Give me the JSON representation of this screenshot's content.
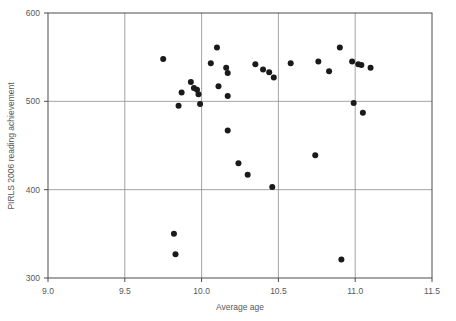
{
  "chart_data": {
    "type": "scatter",
    "title": "",
    "xlabel": "Average age",
    "ylabel": "PIRLS 2006 reading achievement",
    "xlim": [
      9.0,
      11.5
    ],
    "ylim": [
      300,
      600
    ],
    "xticks": [
      "9.0",
      "9.5",
      "10.0",
      "10.5",
      "11.0",
      "11.5"
    ],
    "xtick_values": [
      9.0,
      9.5,
      10.0,
      10.5,
      11.0,
      11.5
    ],
    "yticks": [
      "300",
      "400",
      "500",
      "600"
    ],
    "ytick_values": [
      300,
      400,
      500,
      600
    ],
    "grid": true,
    "grid_x_values": [
      9.5,
      10.0,
      10.5,
      11.0
    ],
    "grid_y_values": [
      400,
      500
    ],
    "legend": "none",
    "marker": "filled-circle",
    "marker_color": "#1a1a1a",
    "marker_size": 3,
    "points": [
      {
        "x": 9.75,
        "y": 548
      },
      {
        "x": 9.82,
        "y": 350
      },
      {
        "x": 9.83,
        "y": 327
      },
      {
        "x": 9.85,
        "y": 495
      },
      {
        "x": 9.87,
        "y": 510
      },
      {
        "x": 9.93,
        "y": 522
      },
      {
        "x": 9.95,
        "y": 515
      },
      {
        "x": 9.97,
        "y": 513
      },
      {
        "x": 9.98,
        "y": 508
      },
      {
        "x": 9.99,
        "y": 497
      },
      {
        "x": 10.06,
        "y": 543
      },
      {
        "x": 10.1,
        "y": 561
      },
      {
        "x": 10.11,
        "y": 517
      },
      {
        "x": 10.16,
        "y": 538
      },
      {
        "x": 10.17,
        "y": 532
      },
      {
        "x": 10.17,
        "y": 506
      },
      {
        "x": 10.17,
        "y": 467
      },
      {
        "x": 10.24,
        "y": 430
      },
      {
        "x": 10.3,
        "y": 417
      },
      {
        "x": 10.35,
        "y": 542
      },
      {
        "x": 10.4,
        "y": 536
      },
      {
        "x": 10.44,
        "y": 533
      },
      {
        "x": 10.46,
        "y": 403
      },
      {
        "x": 10.47,
        "y": 527
      },
      {
        "x": 10.58,
        "y": 543
      },
      {
        "x": 10.74,
        "y": 439
      },
      {
        "x": 10.76,
        "y": 545
      },
      {
        "x": 10.83,
        "y": 534
      },
      {
        "x": 10.9,
        "y": 561
      },
      {
        "x": 10.91,
        "y": 321
      },
      {
        "x": 10.98,
        "y": 545
      },
      {
        "x": 10.99,
        "y": 498
      },
      {
        "x": 11.02,
        "y": 542
      },
      {
        "x": 11.04,
        "y": 541
      },
      {
        "x": 11.05,
        "y": 487
      },
      {
        "x": 11.1,
        "y": 538
      }
    ]
  }
}
